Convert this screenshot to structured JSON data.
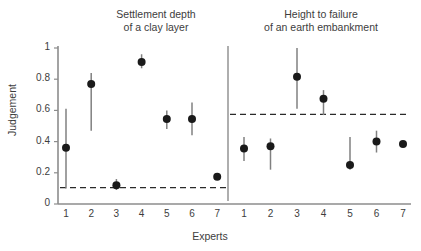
{
  "chart_data": {
    "type": "scatter",
    "title": "",
    "xlabel": "Experts",
    "ylabel": "Judgement",
    "ylim": [
      0,
      1
    ],
    "yticks": [
      "0",
      "0.2",
      "0.4",
      "0.6",
      "0.8",
      "1"
    ],
    "ytick_values": [
      0,
      0.2,
      0.4,
      0.6,
      0.8,
      1
    ],
    "grid": false,
    "legend": "none",
    "categories": [
      "1",
      "2",
      "3",
      "4",
      "5",
      "6",
      "7"
    ],
    "panels": [
      {
        "id": "settlement-depth",
        "title_line1": "Settlement depth",
        "title_line2": "of a clay layer",
        "reference_line": 0.105,
        "reference_line_style": "dashed",
        "categories": [
          "1",
          "2",
          "3",
          "4",
          "5",
          "6",
          "7"
        ],
        "values": [
          0.36,
          0.77,
          0.12,
          0.91,
          0.545,
          0.545,
          0.175
        ],
        "error_low": [
          0.1,
          0.47,
          0.09,
          0.87,
          0.48,
          0.44,
          null
        ],
        "error_high": [
          0.61,
          0.84,
          0.16,
          0.96,
          0.6,
          0.65,
          null
        ]
      },
      {
        "id": "height-to-failure",
        "title_line1": "Height to failure",
        "title_line2": "of an earth embankment",
        "reference_line": 0.575,
        "reference_line_style": "dashed",
        "categories": [
          "1",
          "2",
          "3",
          "4",
          "5",
          "6",
          "7"
        ],
        "values": [
          0.355,
          0.37,
          0.815,
          0.675,
          0.25,
          0.4,
          0.385
        ],
        "error_low": [
          0.275,
          0.22,
          0.61,
          0.57,
          0.22,
          0.33,
          null
        ],
        "error_high": [
          0.43,
          0.42,
          1.0,
          0.73,
          0.43,
          0.47,
          null
        ]
      }
    ],
    "colors": {
      "marker": "#1a1a1a",
      "errorbar": "#808080",
      "axis": "#8c8c8c",
      "reference_line": "#2a2a2a",
      "text": "#3d3d3d",
      "background": "#ffffff"
    }
  }
}
